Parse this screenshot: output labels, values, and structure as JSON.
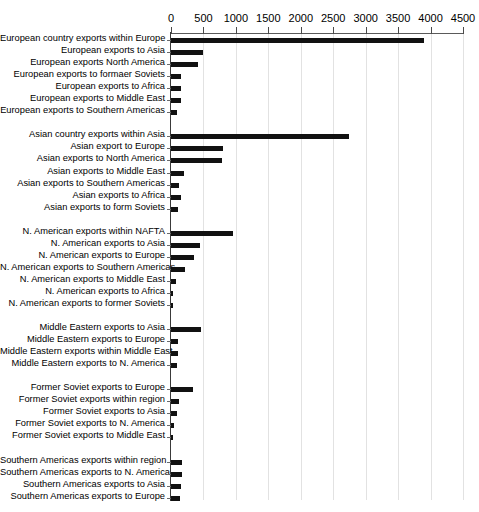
{
  "chart_data": {
    "type": "bar",
    "orientation": "horizontal",
    "title": "",
    "xlabel": "",
    "ylabel": "",
    "xlim": [
      0,
      4500
    ],
    "xticks": [
      0,
      500,
      1000,
      1500,
      2000,
      2500,
      3000,
      3500,
      4000,
      4500
    ],
    "grid": true,
    "legend": "none",
    "bar_color": "#111111",
    "groups": [
      {
        "name": "Europe",
        "categories": [
          "European country exports within Europe",
          "European exports to Asia",
          "European exports North America",
          "European exports to formaer Soviets",
          "European exports to Africa",
          "European exports to Middle East",
          "European exports to Southern Americas"
        ],
        "values": [
          3900,
          500,
          410,
          160,
          150,
          150,
          95
        ]
      },
      {
        "name": "Asia",
        "categories": [
          "Asian country exports within Asia",
          "Asian export to Europe",
          "Asian exports to North America",
          "Asian exports to Middle East",
          "Asian exports to Southern Americas",
          "Asian exports to Africa",
          "Asian exports to form Soviets"
        ],
        "values": [
          2750,
          800,
          790,
          200,
          130,
          160,
          105
        ]
      },
      {
        "name": "North America",
        "categories": [
          "N. American exports within NAFTA",
          "N. American exports to Asia",
          "N. American exports to Europe",
          "N. American exports to Southern Americas",
          "N. American exports to Middle East",
          "N. American exports to Africa",
          "N. American exports to former Soviets"
        ],
        "values": [
          950,
          440,
          350,
          220,
          70,
          35,
          25
        ]
      },
      {
        "name": "Middle East",
        "categories": [
          "Middle Eastern exports to Asia",
          "Middle Eastern exports to Europe",
          "Middle Eastern exports within Middle East",
          "Middle Eastern exports to N. America"
        ],
        "values": [
          460,
          110,
          105,
          95
        ]
      },
      {
        "name": "Former Soviet",
        "categories": [
          "Former Soviet exports to Europe",
          "Former Soviet exports within region",
          "Former Soviet exports to Asia",
          "Former Soviet exports to N. America",
          "Former Soviet exports to Middle East"
        ],
        "values": [
          340,
          130,
          95,
          45,
          20
        ]
      },
      {
        "name": "Southern Americas",
        "categories": [
          "Southern Americas exports within region",
          "Southern Americas exports to N. America",
          "Southern Americas exports to Asia",
          "Southern Americas exports to Europe"
        ],
        "values": [
          165,
          170,
          150,
          140
        ]
      },
      {
        "name": "Africa",
        "categories": [
          "African exports to Europe",
          "African exports to Asia",
          "African exports to N. America",
          "African exports within Africa"
        ],
        "values": [
          200,
          150,
          80,
          60
        ]
      }
    ]
  }
}
